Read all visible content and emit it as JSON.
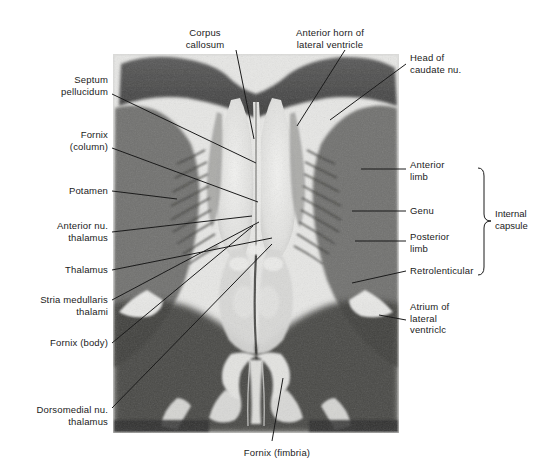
{
  "figure": {
    "kind": "labeled-anatomical-photomicrograph",
    "background_color": "#ffffff",
    "ink_color": "#1b1b1b",
    "specimen": {
      "x": 113,
      "y": 54,
      "width": 286,
      "height": 379,
      "tone": "grayscale myelin-stained coronal slice"
    }
  },
  "labels": {
    "corpus_callosum": "Corpus\ncallosum",
    "anterior_horn": "Anterior horn of\nlateral ventricle",
    "head_of_caudate": "Head of\ncaudate nu.",
    "septum_pellucidum": "Septum\npellucidum",
    "fornix_column": "Fornix\n(column)",
    "putamen": "Potamen",
    "anterior_nu_thalamus": "Anterior nu.\nthalamus",
    "thalamus": "Thalamus",
    "stria_medullaris": "Stria medullaris\nthalami",
    "fornix_body": "Fornix (body)",
    "dorsomedial_nu_thalamus": "Dorsomedial nu.\nthalamus",
    "anterior_limb": "Anterior\nlimb",
    "genu": "Genu",
    "posterior_limb": "Posterior\nlimb",
    "retrolenticular": "Retrolenticular",
    "atrium_lateral_ventricle": "Atrium of\nlateral\nventriclc",
    "internal_capsule": "Internal\ncapsule",
    "fornix_fimbria": "Fornix (fimbria)"
  },
  "label_positions": {
    "corpus_callosum": {
      "x": 205,
      "y": 27,
      "align": "center"
    },
    "anterior_horn": {
      "x": 330,
      "y": 27,
      "align": "center"
    },
    "head_of_caudate": {
      "x": 410,
      "y": 52,
      "align": "left"
    },
    "septum_pellucidum": {
      "x": 108,
      "y": 74,
      "align": "right"
    },
    "fornix_column": {
      "x": 108,
      "y": 129,
      "align": "right"
    },
    "putamen": {
      "x": 108,
      "y": 185,
      "align": "right"
    },
    "anterior_nu_thalamus": {
      "x": 108,
      "y": 220,
      "align": "right"
    },
    "thalamus": {
      "x": 108,
      "y": 264,
      "align": "right"
    },
    "stria_medullaris": {
      "x": 108,
      "y": 294,
      "align": "right"
    },
    "fornix_body": {
      "x": 108,
      "y": 337,
      "align": "right"
    },
    "dorsomedial_nu_thalamus": {
      "x": 108,
      "y": 404,
      "align": "right"
    },
    "anterior_limb": {
      "x": 410,
      "y": 159,
      "align": "left"
    },
    "genu": {
      "x": 410,
      "y": 205,
      "align": "left"
    },
    "posterior_limb": {
      "x": 410,
      "y": 231,
      "align": "left"
    },
    "retrolenticular": {
      "x": 410,
      "y": 265,
      "align": "left"
    },
    "atrium_lateral_ventricle": {
      "x": 410,
      "y": 301,
      "align": "left"
    },
    "internal_capsule": {
      "x": 494,
      "y": 208,
      "align": "left"
    },
    "fornix_fimbria": {
      "x": 277,
      "y": 447,
      "align": "center"
    }
  },
  "leader_lines": {
    "corpus_callosum": {
      "x1": 236,
      "y1": 50,
      "x2": 254,
      "y2": 139
    },
    "anterior_horn": {
      "x1": 345,
      "y1": 50,
      "x2": 297,
      "y2": 126
    },
    "head_of_caudate": {
      "x1": 406,
      "y1": 64,
      "x2": 330,
      "y2": 120
    },
    "septum_pellucidum": {
      "x1": 112,
      "y1": 94,
      "x2": 256,
      "y2": 163
    },
    "fornix_column": {
      "x1": 112,
      "y1": 148,
      "x2": 258,
      "y2": 202
    },
    "putamen": {
      "x1": 112,
      "y1": 191,
      "x2": 177,
      "y2": 199
    },
    "anterior_nu_thalamus": {
      "x1": 112,
      "y1": 232,
      "x2": 252,
      "y2": 216
    },
    "thalamus": {
      "x1": 112,
      "y1": 270,
      "x2": 272,
      "y2": 238
    },
    "stria_medullaris": {
      "x1": 112,
      "y1": 300,
      "x2": 259,
      "y2": 222
    },
    "fornix_body": {
      "x1": 112,
      "y1": 343,
      "x2": 253,
      "y2": 226
    },
    "dorsomedial_nu_thalamus": {
      "x1": 112,
      "y1": 408,
      "x2": 272,
      "y2": 244
    },
    "anterior_limb": {
      "x1": 406,
      "y1": 169,
      "x2": 361,
      "y2": 169
    },
    "genu": {
      "x1": 406,
      "y1": 211,
      "x2": 352,
      "y2": 211
    },
    "posterior_limb": {
      "x1": 406,
      "y1": 241,
      "x2": 355,
      "y2": 241
    },
    "retrolenticular": {
      "x1": 406,
      "y1": 271,
      "x2": 352,
      "y2": 283
    },
    "atrium_lateral_ventricle": {
      "x1": 406,
      "y1": 320,
      "x2": 379,
      "y2": 315
    },
    "fornix_fimbria": {
      "x1": 272,
      "y1": 441,
      "x2": 283,
      "y2": 378
    }
  },
  "bracket": {
    "name": "internal-capsule-bracket",
    "x": 484,
    "y_top": 168,
    "y_bottom": 275,
    "tip_x": 491,
    "tip_y": 221
  }
}
